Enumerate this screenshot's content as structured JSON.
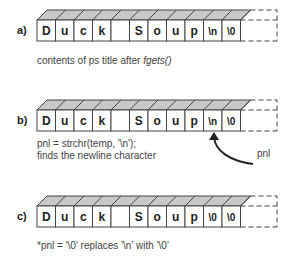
{
  "rows": [
    {
      "label": "a)",
      "cells": [
        "D",
        "u",
        "c",
        "k",
        "",
        "S",
        "o",
        "u",
        "p",
        "\\n",
        "\\0"
      ],
      "caption_lines": [
        "contents of ps title after fgets()"
      ]
    },
    {
      "label": "b)",
      "cells": [
        "D",
        "u",
        "c",
        "k",
        "",
        "S",
        "o",
        "u",
        "p",
        "\\n",
        "\\0"
      ],
      "caption_lines": [
        "pnl = strchr(temp, '\\n');",
        "finds the newline character"
      ],
      "pointer_label": "pnl"
    },
    {
      "label": "c)",
      "cells": [
        "D",
        "u",
        "c",
        "k",
        "",
        "S",
        "o",
        "u",
        "p",
        "\\0",
        "\\0"
      ],
      "caption_lines": [
        "*pnl = '\\0' replaces '\\n' with '\\0'"
      ]
    }
  ],
  "colors": {
    "top_face": "#c8c8c8",
    "stroke": "#444444"
  }
}
